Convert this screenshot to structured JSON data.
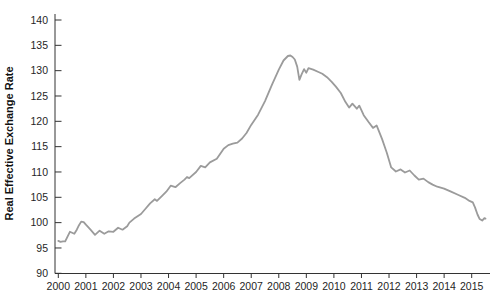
{
  "chart": {
    "ylabel": "Real Effective Exchange Rate"
  },
  "chart_data": {
    "type": "line",
    "title": "",
    "xlabel": "",
    "ylabel": "Real Effective Exchange Rate",
    "xlim": [
      2000,
      2015.83
    ],
    "ylim": [
      90,
      140
    ],
    "x_ticks": [
      2000,
      2001,
      2002,
      2003,
      2004,
      2005,
      2006,
      2007,
      2008,
      2009,
      2010,
      2011,
      2012,
      2013,
      2014,
      2015
    ],
    "y_ticks": [
      90,
      95,
      100,
      105,
      110,
      115,
      120,
      125,
      130,
      135,
      140
    ],
    "grid": false,
    "legend": "none",
    "line_color": "#9b9b9b",
    "axis_color": "#333333",
    "label_color": "#1f1f1f",
    "series": [
      {
        "name": "Real Effective Exchange Rate",
        "x": [
          2000.0,
          2000.08,
          2000.17,
          2000.25,
          2000.33,
          2000.42,
          2000.5,
          2000.58,
          2000.67,
          2000.75,
          2000.83,
          2000.92,
          2001.0,
          2001.17,
          2001.33,
          2001.5,
          2001.67,
          2001.83,
          2002.0,
          2002.17,
          2002.33,
          2002.5,
          2002.58,
          2002.75,
          2003.0,
          2003.17,
          2003.33,
          2003.5,
          2003.58,
          2003.75,
          2003.92,
          2004.08,
          2004.25,
          2004.42,
          2004.58,
          2004.67,
          2004.75,
          2005.0,
          2005.17,
          2005.33,
          2005.5,
          2005.75,
          2006.0,
          2006.17,
          2006.33,
          2006.5,
          2006.67,
          2006.83,
          2007.0,
          2007.25,
          2007.5,
          2007.75,
          2008.0,
          2008.17,
          2008.33,
          2008.42,
          2008.5,
          2008.58,
          2008.67,
          2008.75,
          2008.83,
          2008.92,
          2009.0,
          2009.08,
          2009.25,
          2009.42,
          2009.58,
          2009.75,
          2009.92,
          2010.08,
          2010.25,
          2010.42,
          2010.55,
          2010.67,
          2010.83,
          2010.92,
          2011.08,
          2011.25,
          2011.42,
          2011.55,
          2011.75,
          2011.92,
          2012.08,
          2012.25,
          2012.42,
          2012.58,
          2012.75,
          2012.92,
          2013.08,
          2013.25,
          2013.42,
          2013.58,
          2013.75,
          2014.0,
          2014.25,
          2014.5,
          2014.75,
          2014.92,
          2015.04,
          2015.12,
          2015.21,
          2015.29,
          2015.38,
          2015.46,
          2015.5
        ],
        "y": [
          96.4,
          96.2,
          96.3,
          96.3,
          97.2,
          98.2,
          98.0,
          97.8,
          98.6,
          99.5,
          100.2,
          100.1,
          99.6,
          98.6,
          97.6,
          98.4,
          97.8,
          98.3,
          98.2,
          99.0,
          98.6,
          99.3,
          100.0,
          100.8,
          101.7,
          102.8,
          103.8,
          104.6,
          104.3,
          105.2,
          106.1,
          107.3,
          107.0,
          107.8,
          108.5,
          109.0,
          108.8,
          110.0,
          111.2,
          110.9,
          111.9,
          112.6,
          114.6,
          115.3,
          115.6,
          115.8,
          116.6,
          117.7,
          119.3,
          121.3,
          124.0,
          127.2,
          130.2,
          132.0,
          132.9,
          133.0,
          132.7,
          132.2,
          130.8,
          128.2,
          129.3,
          130.3,
          129.6,
          130.5,
          130.2,
          129.8,
          129.4,
          128.7,
          127.8,
          126.8,
          125.6,
          123.8,
          122.7,
          123.5,
          122.5,
          123.1,
          121.2,
          119.9,
          118.7,
          119.2,
          116.5,
          113.8,
          110.9,
          110.1,
          110.5,
          109.9,
          110.3,
          109.3,
          108.5,
          108.7,
          108.0,
          107.5,
          107.1,
          106.7,
          106.1,
          105.5,
          104.9,
          104.3,
          104.0,
          103.0,
          101.6,
          100.7,
          100.4,
          100.9,
          100.8
        ]
      }
    ]
  }
}
